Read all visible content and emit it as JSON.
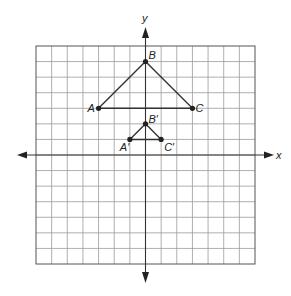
{
  "diagram": {
    "type": "coordinate-plane",
    "grid": {
      "columns": 14,
      "rows": 14,
      "x_min": -7,
      "x_max": 7,
      "y_min": -7,
      "y_max": 7
    },
    "axes": {
      "x_label": "x",
      "y_label": "y"
    },
    "triangles": [
      {
        "name": "ABC",
        "points": [
          {
            "label": "A",
            "x": -3,
            "y": 3
          },
          {
            "label": "B",
            "x": 0,
            "y": 6
          },
          {
            "label": "C",
            "x": 3,
            "y": 3
          }
        ]
      },
      {
        "name": "A'B'C'",
        "points": [
          {
            "label": "A′",
            "x": -1,
            "y": 1
          },
          {
            "label": "B′",
            "x": 0,
            "y": 2
          },
          {
            "label": "C′",
            "x": 1,
            "y": 1
          }
        ]
      }
    ],
    "colors": {
      "grid": "#9a9a9a",
      "lines": "#333333",
      "background": "#ffffff"
    }
  }
}
